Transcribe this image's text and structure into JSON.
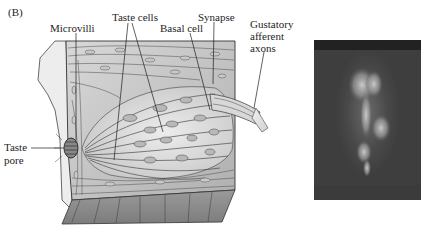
{
  "figure": {
    "panel_label": "(B)",
    "diagram": {
      "subject": "taste bud cross-section",
      "labels": {
        "microvilli": "Microvilli",
        "taste_cells": "Taste cells",
        "basal_cell": "Basal cell",
        "synapse": "Synapse",
        "gustatory_line1": "Gustatory",
        "gustatory_line2": "afferent",
        "gustatory_line3": "axons",
        "taste_pore_line1": "Taste",
        "taste_pore_line2": "pore"
      }
    },
    "photo": {
      "subject": "fluorescence micrograph of taste bud"
    }
  },
  "colors": {
    "ink": "#1e1e1e",
    "tissue_light": "#e4e4e4",
    "tissue_mid": "#bdbdbd",
    "tissue_dark": "#9a9a9a",
    "photo_bg": "#434343"
  }
}
